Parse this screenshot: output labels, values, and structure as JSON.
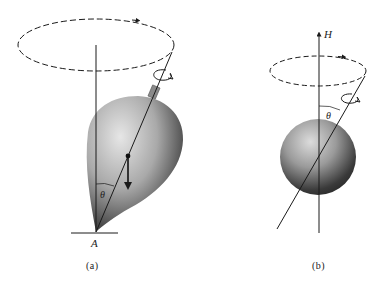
{
  "figure": {
    "panels": [
      {
        "id": "a",
        "caption": "(a)",
        "object": "spinning top (teardrop-shaped) pivoting at point A",
        "labels": {
          "pivot": "A",
          "angle": "θ"
        },
        "elements": [
          "dashed precession circle with arrow",
          "vertical reference line",
          "tilted spin axis",
          "spin rotation arrow",
          "center-of-mass dot with downward weight arrow",
          "ground line"
        ]
      },
      {
        "id": "b",
        "caption": "(b)",
        "object": "sphere with magnetic moment precessing about field H",
        "labels": {
          "field": "H",
          "angle": "θ"
        },
        "elements": [
          "field axis arrow H",
          "dashed precession circle with arrow",
          "tilted spin axis",
          "spin rotation arrow"
        ]
      }
    ]
  },
  "colors": {
    "line": "#1a1a1a",
    "shade_light": "#d8d8d8",
    "shade_dark": "#2a2a2a",
    "background": "#ffffff"
  }
}
